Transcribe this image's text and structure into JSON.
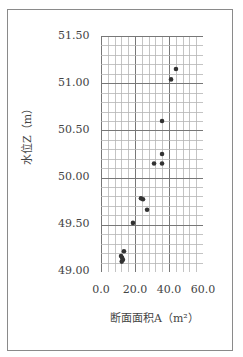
{
  "chart_data": {
    "type": "scatter",
    "title": "",
    "xlabel": "断面面积A（m²）",
    "ylabel": "水位Z（m）",
    "xlim": [
      0.0,
      60.0
    ],
    "ylim": [
      49.0,
      51.5
    ],
    "x_ticks": [
      "0.0",
      "20.0",
      "40.0",
      "60.0"
    ],
    "y_ticks": [
      "51.50",
      "51.00",
      "50.50",
      "50.00",
      "49.50",
      "49.00"
    ],
    "grid": true,
    "grid_minor_x_step": 4.0,
    "grid_minor_y_step": 0.1,
    "legend": null,
    "point_color": "#333333",
    "points": [
      {
        "x": 44.1,
        "y": 51.15
      },
      {
        "x": 41.2,
        "y": 51.04
      },
      {
        "x": 35.9,
        "y": 50.6
      },
      {
        "x": 35.9,
        "y": 50.25
      },
      {
        "x": 31.2,
        "y": 50.15
      },
      {
        "x": 35.9,
        "y": 50.15
      },
      {
        "x": 23.5,
        "y": 49.78
      },
      {
        "x": 24.7,
        "y": 49.77
      },
      {
        "x": 27.1,
        "y": 49.66
      },
      {
        "x": 18.8,
        "y": 49.52
      },
      {
        "x": 13.5,
        "y": 49.22
      },
      {
        "x": 11.8,
        "y": 49.17
      },
      {
        "x": 12.4,
        "y": 49.15
      },
      {
        "x": 12.9,
        "y": 49.13
      },
      {
        "x": 12.2,
        "y": 49.11
      }
    ]
  }
}
